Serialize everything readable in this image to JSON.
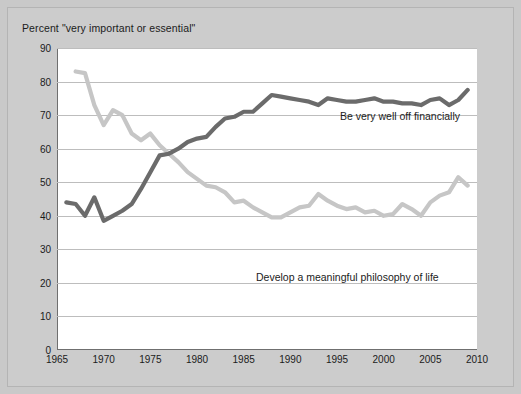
{
  "chart_title": "Percent \"very important or essential\"",
  "series_labels": {
    "financial": "Be very well off financially",
    "philosophy": "Develop a meaningful philosophy of life"
  },
  "colors": {
    "figure_background": "#c9c9c9",
    "plot_background": "#ffffff",
    "gridline": "#bdbdbd",
    "axis": "#6f6f6f",
    "financial_line": "#6b6b6b",
    "philosophy_line": "#c6c6c6",
    "text": "#1b1b1b"
  },
  "chart_data": {
    "type": "line",
    "title": "Percent \"very important or essential\"",
    "xlabel": "",
    "ylabel": "",
    "xlim": [
      1965,
      2010
    ],
    "ylim": [
      0,
      90
    ],
    "xticks": [
      1965,
      1970,
      1975,
      1980,
      1985,
      1990,
      1995,
      2000,
      2005,
      2010
    ],
    "yticks": [
      0,
      10,
      20,
      30,
      40,
      50,
      60,
      70,
      80,
      90
    ],
    "grid": true,
    "legend": "inline-annotations",
    "series": [
      {
        "name": "Be very well off financially",
        "color": "#6b6b6b",
        "x": [
          1966,
          1967,
          1968,
          1969,
          1970,
          1971,
          1972,
          1973,
          1974,
          1975,
          1976,
          1977,
          1978,
          1979,
          1980,
          1981,
          1982,
          1983,
          1984,
          1985,
          1986,
          1987,
          1988,
          1989,
          1990,
          1991,
          1992,
          1993,
          1994,
          1995,
          1996,
          1997,
          1998,
          1999,
          2000,
          2001,
          2002,
          2003,
          2004,
          2005,
          2006,
          2007,
          2008,
          2009
        ],
        "values": [
          44.0,
          43.5,
          40.0,
          45.5,
          38.5,
          40.0,
          41.5,
          43.5,
          48.0,
          53.0,
          58.0,
          58.5,
          60.0,
          62.0,
          63.0,
          63.5,
          66.5,
          69.0,
          69.5,
          71.0,
          71.0,
          73.5,
          76.0,
          75.5,
          75.0,
          74.5,
          74.0,
          73.0,
          75.0,
          74.5,
          74.0,
          74.0,
          74.5,
          75.0,
          74.0,
          74.0,
          73.5,
          73.5,
          73.0,
          74.5,
          75.0,
          73.0,
          74.5,
          77.5
        ]
      },
      {
        "name": "Develop a meaningful philosophy of life",
        "color": "#c6c6c6",
        "x": [
          1967,
          1968,
          1969,
          1970,
          1971,
          1972,
          1973,
          1974,
          1975,
          1976,
          1977,
          1978,
          1979,
          1980,
          1981,
          1982,
          1983,
          1984,
          1985,
          1986,
          1987,
          1988,
          1989,
          1990,
          1991,
          1992,
          1993,
          1994,
          1995,
          1996,
          1997,
          1998,
          1999,
          2000,
          2001,
          2002,
          2003,
          2004,
          2005,
          2006,
          2007,
          2008,
          2009
        ],
        "values": [
          83.0,
          82.5,
          73.0,
          67.0,
          71.5,
          70.0,
          64.5,
          62.5,
          64.5,
          61.0,
          58.5,
          56.0,
          53.0,
          51.0,
          49.0,
          48.5,
          47.0,
          44.0,
          44.5,
          42.5,
          41.0,
          39.5,
          39.5,
          41.0,
          42.5,
          43.0,
          46.5,
          44.5,
          43.0,
          42.0,
          42.5,
          41.0,
          41.5,
          40.0,
          40.5,
          43.5,
          42.0,
          40.0,
          44.0,
          46.0,
          47.0,
          51.5,
          49.0
        ]
      }
    ]
  }
}
